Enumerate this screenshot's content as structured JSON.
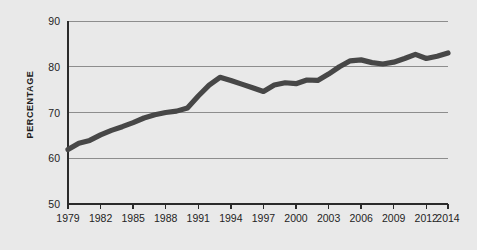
{
  "chart_data": {
    "type": "line",
    "title": "",
    "subtitle": "",
    "xlabel": "",
    "ylabel": "PERCENTAGE",
    "ylim": [
      50,
      90
    ],
    "xlim": [
      1979,
      2014
    ],
    "grid": true,
    "legend": null,
    "y_ticks": [
      50,
      60,
      70,
      80,
      90
    ],
    "y_tick_labels": [
      "50",
      "60",
      "70",
      "80",
      "90"
    ],
    "x_ticks": [
      1979,
      1982,
      1985,
      1988,
      1991,
      1994,
      1997,
      2000,
      2003,
      2006,
      2009,
      2012,
      2014
    ],
    "x_tick_labels": [
      "1979",
      "1982",
      "1985",
      "1988",
      "1991",
      "1994",
      "1997",
      "2000",
      "2003",
      "2006",
      "2009",
      "2012",
      "2014"
    ],
    "series": [
      {
        "name": "percentage",
        "x": [
          1979,
          1980,
          1981,
          1982,
          1983,
          1984,
          1985,
          1986,
          1987,
          1988,
          1989,
          1990,
          1991,
          1992,
          1993,
          1994,
          1995,
          1996,
          1997,
          1998,
          1999,
          2000,
          2001,
          2002,
          2003,
          2004,
          2005,
          2006,
          2007,
          2008,
          2009,
          2010,
          2011,
          2012,
          2013,
          2014
        ],
        "values": [
          61.9,
          63.3,
          63.9,
          65.1,
          66.1,
          66.9,
          67.8,
          68.8,
          69.5,
          70.0,
          70.3,
          71.0,
          73.6,
          76.0,
          77.7,
          77.0,
          76.2,
          75.4,
          74.6,
          76.0,
          76.5,
          76.3,
          77.1,
          77.0,
          78.4,
          80.0,
          81.3,
          81.5,
          80.9,
          80.6,
          81.0,
          81.8,
          82.7,
          81.8,
          82.3,
          83.0
        ]
      }
    ],
    "colors": {
      "background": "#e9e9e9",
      "line": "#474747",
      "grid": "#8d8d8d",
      "axis": "#2b2b2b",
      "text": "#242424"
    }
  },
  "layout": {
    "plot_left": 68,
    "plot_right": 448,
    "plot_top": 21,
    "plot_bottom": 204
  }
}
